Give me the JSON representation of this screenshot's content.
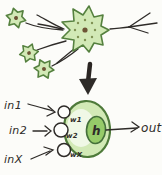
{
  "colors": {
    "cell_fill": "#d2e9b6",
    "cell_stroke": "#55813f",
    "inner_highlight": "#f0f8e6",
    "activation_fill": "#96cb69",
    "ink": "#2e2b28",
    "nucleus": "#6d5435",
    "background": "#fcfcf9"
  },
  "icons": {
    "transition_arrow": "down-arrow",
    "biological_neuron": "neuron-cell-sketch",
    "axon_fork": "branching-axon"
  },
  "model": {
    "inputs": [
      {
        "label": "in1"
      },
      {
        "label": "in2"
      },
      {
        "label": "inX"
      }
    ],
    "weights": [
      {
        "label": "w1"
      },
      {
        "label": "w2"
      },
      {
        "label": "wX"
      }
    ],
    "activation_label": "h",
    "output_label": "out"
  }
}
